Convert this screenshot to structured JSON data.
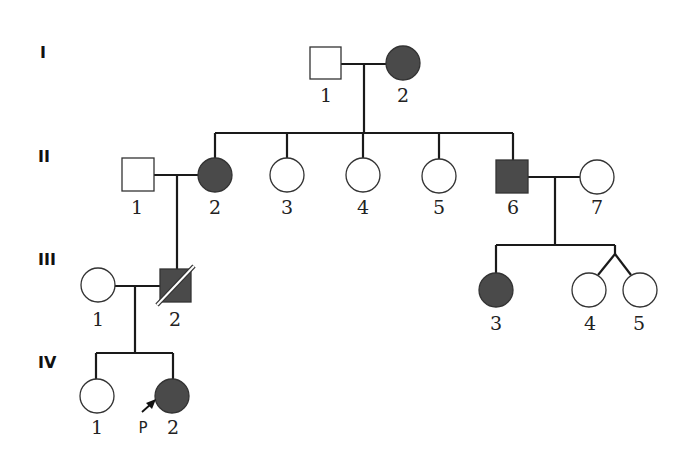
{
  "legend": {
    "affected_color": "#4a4a4a",
    "unaffected_color": "#ffffff",
    "proband_marker": "P"
  },
  "generations": [
    {
      "label": "I",
      "y": 52
    },
    {
      "label": "II",
      "y": 156
    },
    {
      "label": "III",
      "y": 259
    },
    {
      "label": "IV",
      "y": 362
    }
  ],
  "individuals": {
    "I1": {
      "gen": "I",
      "num": "1",
      "sex": "male",
      "affected": false
    },
    "I2": {
      "gen": "I",
      "num": "2",
      "sex": "female",
      "affected": true
    },
    "II1": {
      "gen": "II",
      "num": "1",
      "sex": "male",
      "affected": false
    },
    "II2": {
      "gen": "II",
      "num": "2",
      "sex": "female",
      "affected": true
    },
    "II3": {
      "gen": "II",
      "num": "3",
      "sex": "female",
      "affected": false
    },
    "II4": {
      "gen": "II",
      "num": "4",
      "sex": "female",
      "affected": false
    },
    "II5": {
      "gen": "II",
      "num": "5",
      "sex": "female",
      "affected": false
    },
    "II6": {
      "gen": "II",
      "num": "6",
      "sex": "male",
      "affected": true
    },
    "II7": {
      "gen": "II",
      "num": "7",
      "sex": "female",
      "affected": false
    },
    "III1": {
      "gen": "III",
      "num": "1",
      "sex": "female",
      "affected": false
    },
    "III2": {
      "gen": "III",
      "num": "2",
      "sex": "male",
      "affected": true,
      "deceased": true
    },
    "III3": {
      "gen": "III",
      "num": "3",
      "sex": "female",
      "affected": true
    },
    "III4": {
      "gen": "III",
      "num": "4",
      "sex": "female",
      "affected": false,
      "twin_of": "III5"
    },
    "III5": {
      "gen": "III",
      "num": "5",
      "sex": "female",
      "affected": false,
      "twin_of": "III4"
    },
    "IV1": {
      "gen": "IV",
      "num": "1",
      "sex": "female",
      "affected": false
    },
    "IV2": {
      "gen": "IV",
      "num": "2",
      "sex": "female",
      "affected": true,
      "proband": true
    }
  },
  "matings": [
    {
      "partners": [
        "I1",
        "I2"
      ],
      "children": [
        "II2",
        "II3",
        "II4",
        "II5",
        "II6"
      ]
    },
    {
      "partners": [
        "II1",
        "II2"
      ],
      "children": [
        "III2"
      ]
    },
    {
      "partners": [
        "II6",
        "II7"
      ],
      "children": [
        "III3",
        "III4",
        "III5"
      ]
    },
    {
      "partners": [
        "III1",
        "III2"
      ],
      "children": [
        "IV1",
        "IV2"
      ]
    }
  ]
}
